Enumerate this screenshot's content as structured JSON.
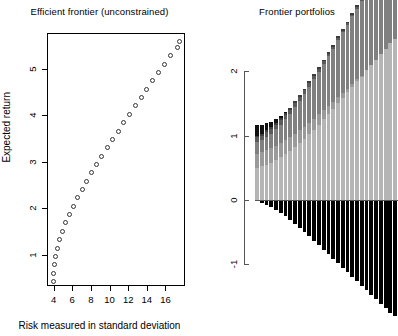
{
  "page": {
    "background": "#ffffff",
    "width": 398,
    "height": 336
  },
  "chart_data": [
    {
      "id": "efficient-frontier",
      "type": "scatter",
      "title": "Efficient frontier (unconstrained)",
      "xlabel": "Risk measured in standard deviation",
      "ylabel": "Expected return",
      "xlim": [
        3.4,
        18.2
      ],
      "ylim": [
        0.3,
        5.75
      ],
      "xticks": [
        4,
        6,
        8,
        10,
        12,
        14,
        16
      ],
      "xticklabels": [
        "4",
        "6",
        "8",
        "10",
        "12",
        "14",
        "16"
      ],
      "yticks": [
        1,
        2,
        3,
        4,
        5
      ],
      "yticklabels": [
        "1",
        "2",
        "3",
        "4",
        "5"
      ],
      "grid": false,
      "marker": "open-circle",
      "marker_color": "#333333",
      "legend": null,
      "x": [
        3.95,
        3.99,
        4.08,
        4.22,
        4.42,
        4.67,
        4.97,
        5.32,
        5.7,
        6.12,
        6.57,
        7.05,
        7.55,
        8.07,
        8.61,
        9.17,
        9.74,
        10.32,
        10.92,
        11.52,
        12.13,
        12.75,
        13.38,
        14.01,
        14.65,
        15.29,
        15.94,
        16.59,
        17.24,
        17.45
      ],
      "y": [
        0.42,
        0.6,
        0.78,
        0.96,
        1.14,
        1.32,
        1.5,
        1.68,
        1.86,
        2.04,
        2.22,
        2.4,
        2.58,
        2.76,
        2.94,
        3.12,
        3.3,
        3.48,
        3.66,
        3.84,
        4.02,
        4.2,
        4.38,
        4.56,
        4.74,
        4.92,
        5.1,
        5.28,
        5.46,
        5.58
      ]
    },
    {
      "id": "frontier-portfolios",
      "type": "bar",
      "title": "Frontier portfolios",
      "xlabel": "",
      "ylabel": "",
      "stacked": true,
      "grid": false,
      "ylim": [
        -1.35,
        2.25
      ],
      "yticks": [
        2,
        1,
        0,
        -1
      ],
      "yticklabels": [
        "2",
        "1",
        "0",
        "-1"
      ],
      "series": [
        {
          "name": "asset-1",
          "color": "#b5b5b5",
          "values": [
            0.5,
            0.52,
            0.55,
            0.58,
            0.62,
            0.66,
            0.71,
            0.76,
            0.82,
            0.88,
            0.95,
            1.02,
            1.09,
            1.17,
            1.25,
            1.33,
            1.41,
            1.5,
            1.58,
            1.67,
            1.75,
            1.84,
            1.92,
            2.01,
            2.09,
            2.18,
            2.26,
            2.35,
            2.43,
            2.5
          ]
        },
        {
          "name": "asset-2",
          "color": "#9a9a9a",
          "values": [
            0.22,
            0.22,
            0.22,
            0.22,
            0.22,
            0.22,
            0.22,
            0.21,
            0.21,
            0.2,
            0.19,
            0.18,
            0.17,
            0.16,
            0.14,
            0.13,
            0.11,
            0.1,
            0.08,
            0.06,
            0.05,
            0.03,
            0.01,
            0.0,
            0.0,
            0.0,
            0.0,
            0.0,
            0.0,
            0.0
          ]
        },
        {
          "name": "asset-3",
          "color": "#808080",
          "values": [
            0.18,
            0.19,
            0.21,
            0.23,
            0.26,
            0.29,
            0.33,
            0.37,
            0.41,
            0.46,
            0.51,
            0.56,
            0.61,
            0.66,
            0.72,
            0.77,
            0.83,
            0.88,
            0.94,
            0.99,
            1.05,
            1.1,
            1.16,
            1.21,
            1.27,
            1.32,
            1.38,
            1.43,
            1.49,
            1.54
          ]
        },
        {
          "name": "asset-4",
          "color": "#5a5a5a",
          "values": [
            0.07,
            0.07,
            0.07,
            0.07,
            0.07,
            0.07,
            0.06,
            0.06,
            0.06,
            0.06,
            0.05,
            0.05,
            0.05,
            0.04,
            0.04,
            0.04,
            0.03,
            0.03,
            0.03,
            0.02,
            0.02,
            0.02,
            0.01,
            0.01,
            0.01,
            0.0,
            0.0,
            0.0,
            0.0,
            0.0
          ]
        },
        {
          "name": "asset-5",
          "color": "#3c3c3c",
          "values": [
            0.03,
            0.03,
            0.03,
            0.03,
            0.03,
            0.03,
            0.03,
            0.03,
            0.03,
            0.03,
            0.03,
            0.03,
            0.03,
            0.03,
            0.03,
            0.03,
            0.03,
            0.03,
            0.03,
            0.03,
            0.03,
            0.03,
            0.03,
            0.03,
            0.03,
            0.03,
            0.03,
            0.03,
            0.03,
            0.03
          ]
        },
        {
          "name": "asset-6-negative",
          "color": "#000000",
          "values": [
            -0.02,
            -0.04,
            -0.07,
            -0.11,
            -0.15,
            -0.2,
            -0.25,
            -0.31,
            -0.37,
            -0.43,
            -0.5,
            -0.56,
            -0.63,
            -0.7,
            -0.77,
            -0.84,
            -0.91,
            -0.98,
            -1.05,
            -1.12,
            -1.19,
            -1.26,
            -1.33,
            -1.4,
            -1.47,
            -1.54,
            -1.61,
            -1.68,
            -1.75,
            -1.8
          ]
        },
        {
          "name": "asset-7-top-dark",
          "color": "#111111",
          "values": [
            0.17,
            0.14,
            0.11,
            0.08,
            0.05,
            0.03,
            0.01,
            0.0,
            0.0,
            0.0,
            0.0,
            0.0,
            0.0,
            0.0,
            0.0,
            0.0,
            0.0,
            0.0,
            0.0,
            0.0,
            0.0,
            0.0,
            0.0,
            0.0,
            0.0,
            0.0,
            0.0,
            0.0,
            0.0,
            0.0
          ]
        }
      ],
      "n_bars": 30
    }
  ],
  "left_plot": {
    "title": "Efficient frontier (unconstrained)",
    "xlabel": "Risk measured in standard deviation",
    "ylabel": "Expected return"
  },
  "right_plot": {
    "title": "Frontier portfolios"
  }
}
